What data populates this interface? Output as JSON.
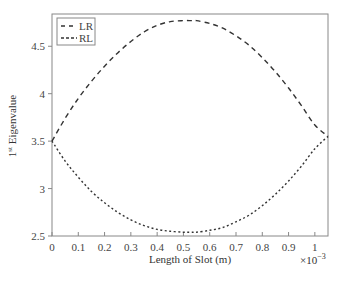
{
  "chart_data": {
    "type": "line",
    "title": "",
    "xlabel": "Length of Slot (m)",
    "x_multiplier": "×10",
    "x_multiplier_exp": "−3",
    "ylabel_main": "1",
    "ylabel_sup": "st",
    "ylabel_rest": " Eigenvalue",
    "xlim": [
      0,
      1.05
    ],
    "ylim": [
      2.5,
      4.84
    ],
    "xticks": [
      0,
      0.1,
      0.2,
      0.3,
      0.4,
      0.5,
      0.6,
      0.7,
      0.8,
      0.9,
      1
    ],
    "xtick_labels": [
      "0",
      "0.1",
      "0.2",
      "0.3",
      "0.4",
      "0.5",
      "0.6",
      "0.7",
      "0.8",
      "0.9",
      "1"
    ],
    "yticks": [
      2.5,
      3,
      3.5,
      4,
      4.5
    ],
    "ytick_labels": [
      "2.5",
      "3",
      "3.5",
      "4",
      "4.5"
    ],
    "grid": false,
    "legend_position": "upper left",
    "x": [
      0,
      0.05,
      0.1,
      0.15,
      0.2,
      0.25,
      0.3,
      0.35,
      0.4,
      0.45,
      0.5,
      0.53,
      0.55,
      0.6,
      0.65,
      0.7,
      0.75,
      0.8,
      0.85,
      0.9,
      0.95,
      1.0,
      1.05
    ],
    "series": [
      {
        "name": "LR",
        "style": "dashed",
        "values": [
          3.5,
          3.74,
          3.95,
          4.13,
          4.29,
          4.43,
          4.55,
          4.65,
          4.72,
          4.76,
          4.77,
          4.77,
          4.77,
          4.74,
          4.69,
          4.61,
          4.51,
          4.38,
          4.23,
          4.06,
          3.87,
          3.67,
          3.55
        ]
      },
      {
        "name": "RL",
        "style": "dotted",
        "values": [
          3.5,
          3.29,
          3.12,
          2.97,
          2.85,
          2.75,
          2.67,
          2.61,
          2.57,
          2.55,
          2.54,
          2.54,
          2.54,
          2.56,
          2.59,
          2.65,
          2.72,
          2.82,
          2.94,
          3.08,
          3.24,
          3.42,
          3.55
        ]
      }
    ]
  },
  "colors": {
    "frame": "#888888",
    "line": "#333333",
    "background": "#ffffff"
  }
}
